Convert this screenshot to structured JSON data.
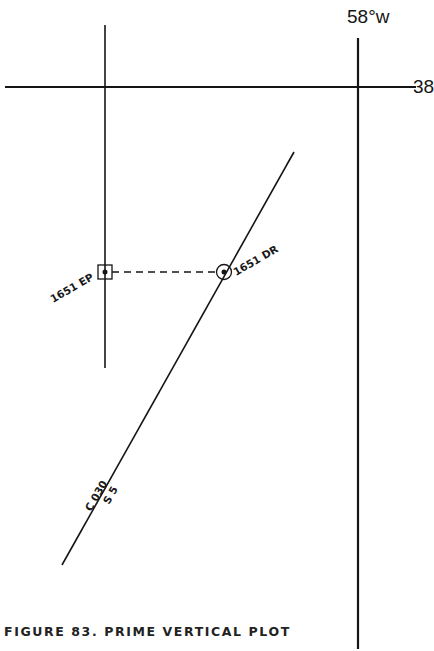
{
  "figure": {
    "caption": "FIGURE 83. PRIME VERTICAL PLOT",
    "longitude_label": "58°w",
    "latitude_label": "38",
    "ep_label": "1651 EP",
    "dr_label": "1651 DR",
    "course_label": "C 030",
    "speed_label": "S 5",
    "colors": {
      "ink": "#151515",
      "background": "#ffffff"
    }
  }
}
